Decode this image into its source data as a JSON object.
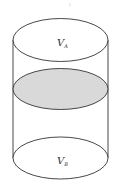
{
  "diagram": {
    "type": "cylinder-partition",
    "top_label": {
      "main": "V",
      "sub": "A"
    },
    "bottom_label": {
      "main": "V",
      "sub": "B"
    },
    "partition": {
      "fill": "#d9d9d9",
      "description": "shaded piston/partition"
    },
    "stroke_color": "#333333"
  }
}
